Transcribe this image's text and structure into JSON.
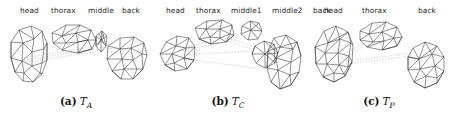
{
  "figure": {
    "type": "triangulated-mesh-diagram",
    "background_color": "#ffffff",
    "mesh_line_color": "#303030",
    "connector_line_color": "#9a9a9a",
    "panels": [
      {
        "id": "a",
        "caption_tag": "(a)",
        "caption_symbol": "T",
        "caption_subscript": "A",
        "part_labels": [
          {
            "text": "head",
            "x": 20
          },
          {
            "text": "thorax",
            "x": 51
          },
          {
            "text": "middle",
            "x": 88
          },
          {
            "text": "back",
            "x": 122
          }
        ]
      },
      {
        "id": "b",
        "caption_tag": "(b)",
        "caption_symbol": "T",
        "caption_subscript": "C",
        "part_labels": [
          {
            "text": "head",
            "x": 14
          },
          {
            "text": "thorax",
            "x": 44
          },
          {
            "text": "middle1",
            "x": 79
          },
          {
            "text": "middle2",
            "x": 120
          },
          {
            "text": "back",
            "x": 161
          }
        ]
      },
      {
        "id": "c",
        "caption_tag": "(c)",
        "caption_symbol": "T",
        "caption_subscript": "P",
        "part_labels": [
          {
            "text": "head",
            "x": 20
          },
          {
            "text": "thorax",
            "x": 58
          },
          {
            "text": "back",
            "x": 114
          }
        ]
      }
    ]
  }
}
